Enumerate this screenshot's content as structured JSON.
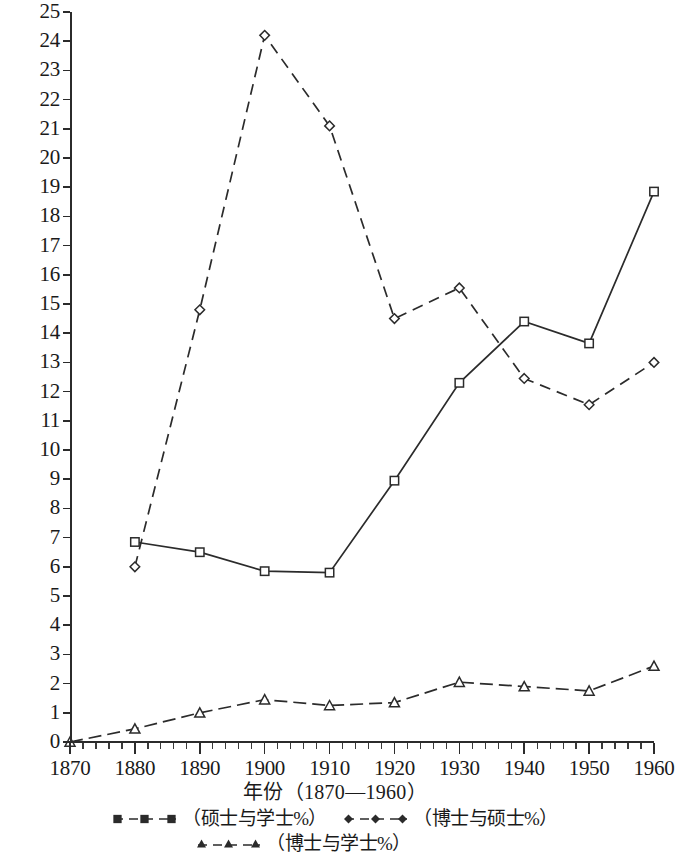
{
  "chart_data": {
    "type": "line",
    "title": "",
    "xlabel": "年份（1870—1960）",
    "ylabel": "",
    "x": [
      1870,
      1880,
      1890,
      1900,
      1910,
      1920,
      1930,
      1940,
      1950,
      1960
    ],
    "xtick_labels": [
      "1870",
      "1880",
      "1890",
      "1900",
      "1910",
      "1920",
      "1930",
      "1940",
      "1950",
      "1960"
    ],
    "ytick_labels": [
      "0",
      "1",
      "2",
      "3",
      "4",
      "5",
      "6",
      "7",
      "8",
      "9",
      "10",
      "11",
      "12",
      "13",
      "14",
      "15",
      "16",
      "17",
      "18",
      "19",
      "20",
      "21",
      "22",
      "23",
      "24",
      "25"
    ],
    "xlim": [
      1870,
      1960
    ],
    "ylim": [
      0,
      25
    ],
    "grid": false,
    "legend_position": "below",
    "series": [
      {
        "name": "（硕士与学士%）",
        "marker": "square",
        "linestyle": "solid",
        "color": "#2b2b2b",
        "x": [
          1880,
          1890,
          1900,
          1910,
          1920,
          1930,
          1940,
          1950,
          1960
        ],
        "values": [
          6.85,
          6.5,
          5.85,
          5.8,
          8.95,
          12.3,
          14.4,
          13.65,
          18.85
        ]
      },
      {
        "name": "（博士与硕士%）",
        "marker": "diamond",
        "linestyle": "dashed",
        "color": "#2b2b2b",
        "x": [
          1880,
          1890,
          1900,
          1910,
          1920,
          1930,
          1940,
          1950,
          1960
        ],
        "values": [
          6.0,
          14.8,
          24.2,
          21.1,
          14.5,
          15.55,
          12.45,
          11.55,
          13.0
        ]
      },
      {
        "name": "（博士与学士%）",
        "marker": "triangle",
        "linestyle": "dashdot",
        "color": "#2b2b2b",
        "x": [
          1870,
          1880,
          1890,
          1900,
          1910,
          1920,
          1930,
          1940,
          1950,
          1960
        ],
        "values": [
          0.0,
          0.45,
          1.0,
          1.45,
          1.25,
          1.35,
          2.05,
          1.9,
          1.75,
          2.6
        ]
      }
    ]
  },
  "axis": {
    "x_title": "年份（1870—1960）"
  },
  "legend": {
    "entries": [
      {
        "label": "（硕士与学士%）",
        "marker": "square-marker-icon"
      },
      {
        "label": "（博士与硕士%）",
        "marker": "diamond-marker-icon"
      },
      {
        "label": "（博士与学士%）",
        "marker": "triangle-marker-icon"
      }
    ]
  }
}
